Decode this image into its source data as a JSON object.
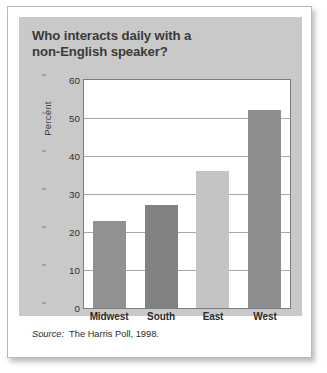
{
  "card": {
    "title_line1": "Who interacts daily with a",
    "title_line2": "non-English speaker?",
    "source_label": "Source:",
    "source_text": "The Harris Poll, 1998."
  },
  "chart_data": {
    "type": "bar",
    "title": "Who interacts daily with a non-English speaker?",
    "categories": [
      "Midwest",
      "South",
      "East",
      "West"
    ],
    "values": [
      23,
      27,
      36,
      52
    ],
    "xlabel": "",
    "ylabel": "Percent",
    "ylim": [
      0,
      60
    ],
    "yticks": [
      0,
      10,
      20,
      30,
      40,
      50,
      60
    ],
    "ytick_labels": [
      "0",
      "10",
      "20",
      "30",
      "40",
      "50",
      "60"
    ],
    "grid": true,
    "legend": "none",
    "bar_colors": [
      "#919191",
      "#828282",
      "#c4c4c4",
      "#8e8e8e"
    ]
  }
}
